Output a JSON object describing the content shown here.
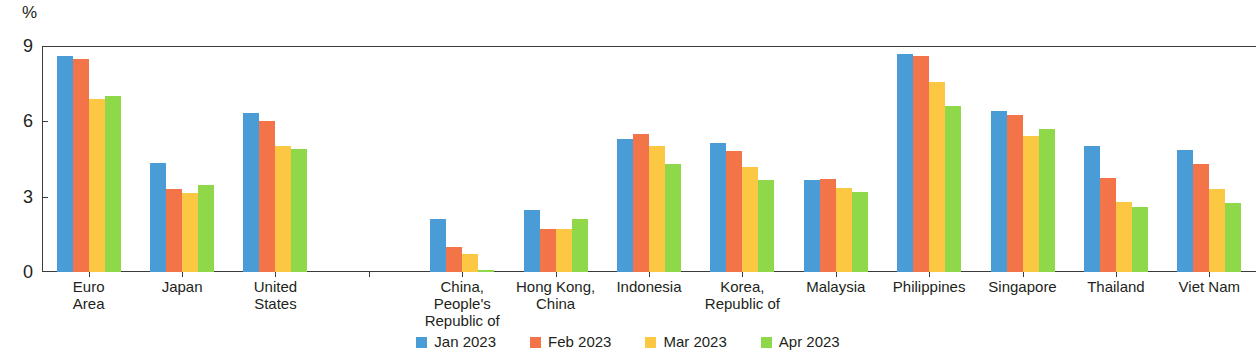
{
  "chart_data": {
    "type": "bar",
    "title": "",
    "subtitle": "",
    "xlabel": "",
    "ylabel": "%",
    "ylim": [
      0,
      9
    ],
    "yticks": [
      0,
      3,
      6,
      9
    ],
    "ytick_labels": [
      "0",
      "3",
      "6",
      "9"
    ],
    "grid": false,
    "legend_position": "bottom",
    "unit_label": "%",
    "categories": [
      "Euro\nArea",
      "Japan",
      "United\nStates",
      "",
      "China,\nPeople's\nRepublic of",
      "Hong Kong,\nChina",
      "Indonesia",
      "Korea,\nRepublic of",
      "Malaysia",
      "Philippines",
      "Singapore",
      "Thailand",
      "Viet Nam"
    ],
    "series": [
      {
        "name": "Jan 2023",
        "color": "#4a9cd6",
        "values": [
          8.6,
          4.35,
          6.35,
          null,
          2.1,
          2.45,
          5.3,
          5.15,
          3.65,
          8.7,
          6.4,
          5.0,
          4.85
        ]
      },
      {
        "name": "Feb 2023",
        "color": "#f4744a",
        "values": [
          8.5,
          3.3,
          6.0,
          null,
          1.0,
          1.7,
          5.5,
          4.8,
          3.7,
          8.6,
          6.25,
          3.75,
          4.3
        ]
      },
      {
        "name": "Mar 2023",
        "color": "#fcc843",
        "values": [
          6.9,
          3.15,
          5.0,
          null,
          0.7,
          1.7,
          5.0,
          4.2,
          3.35,
          7.55,
          5.4,
          2.8,
          3.3
        ]
      },
      {
        "name": "Apr 2023",
        "color": "#8ed84a",
        "values": [
          7.0,
          3.45,
          4.9,
          null,
          0.1,
          2.1,
          4.3,
          3.65,
          3.2,
          6.6,
          5.7,
          2.6,
          2.75
        ]
      }
    ]
  },
  "legend": {
    "items": [
      {
        "label": "Jan 2023",
        "swatch": "legend-swatch-blue"
      },
      {
        "label": "Feb 2023",
        "swatch": "legend-swatch-orange"
      },
      {
        "label": "Mar 2023",
        "swatch": "legend-swatch-yellow"
      },
      {
        "label": "Apr 2023",
        "swatch": "legend-swatch-green"
      }
    ]
  },
  "colors": {
    "jan": "#4a9cd6",
    "feb": "#f4744a",
    "mar": "#fcc843",
    "apr": "#8ed84a",
    "axis": "#3b3b3b",
    "text": "#221f20",
    "background": "#ffffff"
  }
}
